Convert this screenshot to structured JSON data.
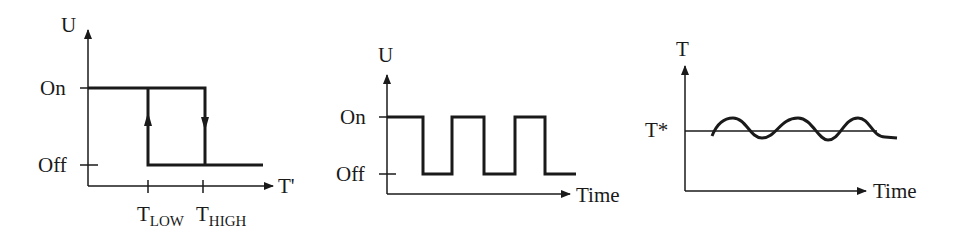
{
  "diagrams": [
    {
      "id": "hysteresis",
      "y_axis_label": "U",
      "x_axis_label": "T'",
      "levels": [
        "On",
        "Off"
      ],
      "x_ticks": [
        {
          "main": "T",
          "sub": "LOW"
        },
        {
          "main": "T",
          "sub": "HIGH"
        }
      ]
    },
    {
      "id": "on-off-signal",
      "y_axis_label": "U",
      "x_axis_label": "Time",
      "levels": [
        "On",
        "Off"
      ],
      "pulses": 3
    },
    {
      "id": "temperature-oscillation",
      "y_axis_label": "T",
      "x_axis_label": "Time",
      "setpoint_label": "T*"
    }
  ],
  "colors": {
    "ink": "#1a1a1a",
    "background": "#ffffff"
  }
}
